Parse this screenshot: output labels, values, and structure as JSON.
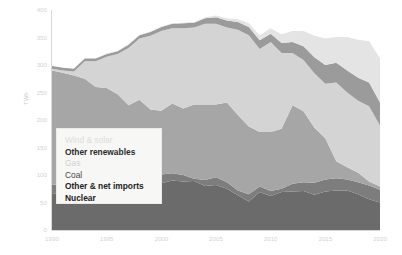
{
  "axis": {
    "ylabel": "TWh",
    "yticks": [
      "0",
      "50",
      "100",
      "150",
      "200",
      "250",
      "300",
      "350",
      "400"
    ],
    "xticks": [
      "1990",
      "1995",
      "2000",
      "2005",
      "2010",
      "2015",
      "2020"
    ]
  },
  "legend": {
    "items": [
      {
        "label": "Wind & solar",
        "color": "#e4e4e4"
      },
      {
        "label": "Other renewables",
        "color": "#9b9b9b"
      },
      {
        "label": "Gas",
        "color": "#d4d4d4"
      },
      {
        "label": "Coal",
        "color": "#a6a6a6"
      },
      {
        "label": "Other & net imports",
        "color": "#7d7d7d"
      },
      {
        "label": "Nuclear",
        "color": "#6b6b6b"
      }
    ]
  },
  "chart_data": {
    "type": "area",
    "stacked": true,
    "title": "",
    "xlabel": "",
    "ylabel": "TWh",
    "xlim": [
      1990,
      2020
    ],
    "ylim": [
      0,
      400
    ],
    "grid": false,
    "legend_position": "inside-lower-left",
    "x": [
      1990,
      1991,
      1992,
      1993,
      1994,
      1995,
      1996,
      1997,
      1998,
      1999,
      2000,
      2001,
      2002,
      2003,
      2004,
      2005,
      2006,
      2007,
      2008,
      2009,
      2010,
      2011,
      2012,
      2013,
      2014,
      2015,
      2016,
      2017,
      2018,
      2019,
      2020
    ],
    "series": [
      {
        "name": "Nuclear",
        "color": "#6b6b6b",
        "values": [
          65,
          68,
          76,
          89,
          88,
          89,
          94,
          98,
          100,
          96,
          85,
          90,
          88,
          89,
          80,
          82,
          75,
          63,
          52,
          69,
          62,
          69,
          70,
          71,
          64,
          70,
          72,
          72,
          65,
          56,
          50
        ]
      },
      {
        "name": "Other & net imports",
        "color": "#7d7d7d",
        "values": [
          17,
          16,
          17,
          18,
          18,
          18,
          17,
          17,
          18,
          17,
          16,
          13,
          12,
          4,
          11,
          14,
          12,
          9,
          13,
          10,
          9,
          6,
          14,
          16,
          22,
          22,
          22,
          20,
          22,
          25,
          23
        ]
      },
      {
        "name": "Coal",
        "color": "#a6a6a6",
        "values": [
          208,
          202,
          188,
          168,
          154,
          151,
          136,
          112,
          119,
          106,
          116,
          127,
          121,
          135,
          137,
          132,
          145,
          137,
          123,
          99,
          107,
          109,
          143,
          129,
          100,
          75,
          31,
          22,
          17,
          7,
          6
        ]
      },
      {
        "name": "Gas",
        "color": "#d4d4d4",
        "values": [
          3,
          4,
          7,
          32,
          47,
          57,
          73,
          104,
          111,
          134,
          145,
          137,
          146,
          140,
          147,
          147,
          136,
          155,
          166,
          151,
          164,
          138,
          95,
          93,
          99,
          99,
          143,
          136,
          131,
          137,
          111
        ]
      },
      {
        "name": "Other renewables",
        "color": "#9b9b9b",
        "values": [
          5,
          5,
          5,
          5,
          5,
          5,
          5,
          6,
          6,
          7,
          7,
          8,
          9,
          9,
          10,
          12,
          13,
          14,
          15,
          16,
          15,
          18,
          20,
          25,
          29,
          34,
          36,
          40,
          42,
          43,
          42
        ]
      },
      {
        "name": "Wind & solar",
        "color": "#e4e4e4",
        "values": [
          0,
          0,
          0,
          0,
          0,
          1,
          1,
          1,
          1,
          1,
          1,
          1,
          1,
          1,
          2,
          3,
          4,
          5,
          7,
          9,
          10,
          16,
          20,
          28,
          39,
          48,
          47,
          61,
          69,
          75,
          80
        ]
      }
    ]
  }
}
